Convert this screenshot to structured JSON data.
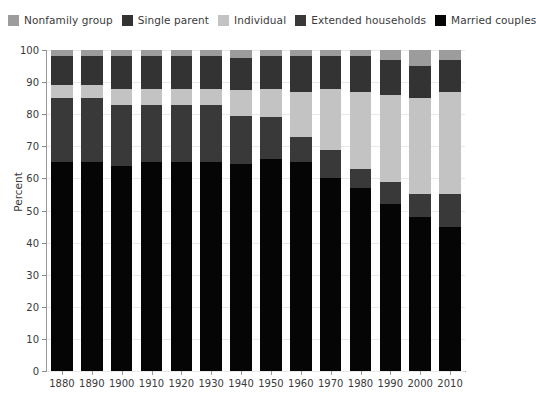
{
  "chart_data": {
    "type": "bar",
    "subtype": "stacked-bar-100-percent",
    "title": "",
    "xlabel": "",
    "ylabel": "Percent",
    "ylim": [
      0,
      100
    ],
    "ytick_step": 10,
    "yticks": [
      0,
      10,
      20,
      30,
      40,
      50,
      60,
      70,
      80,
      90,
      100
    ],
    "grid": true,
    "legend_position": "top",
    "categories": [
      "1880",
      "1890",
      "1900",
      "1910",
      "1920",
      "1930",
      "1940",
      "1950",
      "1960",
      "1970",
      "1980",
      "1990",
      "2000",
      "2010"
    ],
    "stack_order_bottom_to_top": [
      "Married couples",
      "Extended households",
      "Individual",
      "Single parent",
      "Nonfamily group"
    ],
    "series": [
      {
        "name": "Married couples",
        "color": "#050505",
        "values": [
          65,
          65,
          64,
          65,
          65,
          65,
          64.5,
          66,
          65,
          60,
          57,
          52,
          48,
          45
        ]
      },
      {
        "name": "Extended households",
        "color": "#393939",
        "values": [
          20,
          20,
          19,
          18,
          18,
          18,
          15,
          13,
          8,
          9,
          6,
          7,
          7,
          10
        ]
      },
      {
        "name": "Individual",
        "color": "#c3c3c3",
        "values": [
          4,
          4,
          5,
          5,
          5,
          5,
          8,
          9,
          14,
          19,
          24,
          27,
          30,
          32
        ]
      },
      {
        "name": "Single parent",
        "color": "#333333",
        "values": [
          9,
          9,
          10,
          10,
          10,
          10,
          10,
          10,
          11,
          10,
          11,
          11,
          10,
          10
        ]
      },
      {
        "name": "Nonfamily group",
        "color": "#9c9c9c",
        "values": [
          2,
          2,
          2,
          2,
          2,
          2,
          2.5,
          2,
          2,
          2,
          2,
          3,
          5,
          3
        ]
      }
    ]
  },
  "legend": {
    "items": [
      {
        "label": "Nonfamily group",
        "color": "#9c9c9c"
      },
      {
        "label": "Single parent",
        "color": "#333333"
      },
      {
        "label": "Individual",
        "color": "#c3c3c3"
      },
      {
        "label": "Extended households",
        "color": "#393939"
      },
      {
        "label": "Married couples",
        "color": "#050505"
      }
    ]
  },
  "axes": {
    "y_title": "Percent"
  }
}
